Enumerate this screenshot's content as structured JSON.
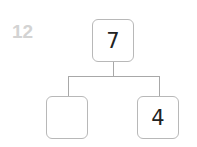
{
  "problem_number": "12",
  "number_bond": {
    "whole": "7",
    "parts": [
      "",
      "4"
    ]
  },
  "colors": {
    "problem_number": "#d3d3d3",
    "box_border": "#b8b8b8",
    "connector": "#a8a8a8",
    "text": "#222222"
  }
}
